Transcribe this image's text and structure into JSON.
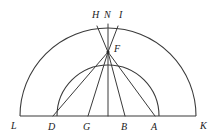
{
  "figure": {
    "type": "geometry-diagram",
    "background_color": "#ffffff",
    "stroke_color": "#3a3a3a",
    "label_color": "#1a1a1a",
    "baseline": {
      "label_left": "L",
      "label_right": "K",
      "y": 116,
      "x_start": 20,
      "x_end": 196
    },
    "outer_arc": {
      "name": "semicircle-LK",
      "center_x": 108,
      "center_y": 116,
      "radius": 88,
      "apex_y": 24
    },
    "inner_arc": {
      "name": "semicircle-DA",
      "center_x": 108,
      "center_y": 116,
      "radius": 51,
      "apex_y": 52
    },
    "apex_point": {
      "label": "F",
      "x": 108,
      "y": 52
    },
    "top_labels": [
      {
        "label": "H",
        "x": 92,
        "y": 10
      },
      {
        "label": "N",
        "x": 104,
        "y": 10
      },
      {
        "label": "I",
        "x": 118,
        "y": 10
      }
    ],
    "baseline_labels": [
      {
        "label": "L",
        "x": 11,
        "y": 122
      },
      {
        "label": "D",
        "x": 48,
        "y": 122
      },
      {
        "label": "G",
        "x": 83,
        "y": 122
      },
      {
        "label": "B",
        "x": 121,
        "y": 122
      },
      {
        "label": "A",
        "x": 151,
        "y": 122
      },
      {
        "label": "K",
        "x": 200,
        "y": 122
      }
    ],
    "apex_label": {
      "label": "F",
      "x": 114,
      "y": 44
    },
    "rays_from_apex": [
      {
        "name": "ray-F-D",
        "to_x": 53
      },
      {
        "name": "ray-F-G",
        "to_x": 88
      },
      {
        "name": "ray-F-center",
        "to_x": 108
      },
      {
        "name": "ray-F-B",
        "to_x": 125
      },
      {
        "name": "ray-F-A",
        "to_x": 155
      }
    ],
    "rays_to_top": [
      {
        "name": "ray-F-H",
        "to_x": 97,
        "to_y": 26
      },
      {
        "name": "ray-F-N",
        "to_x": 108,
        "to_y": 24
      },
      {
        "name": "ray-F-I",
        "to_x": 118,
        "to_y": 26
      }
    ]
  }
}
